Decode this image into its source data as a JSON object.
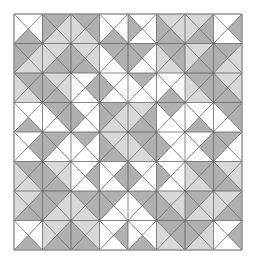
{
  "figure": {
    "type": "geometric-quilt-pattern"
  },
  "canvas": {
    "width": 256,
    "height": 262,
    "background": "#ffffff"
  },
  "pattern": {
    "origin_x": 14,
    "origin_y": 14,
    "grid_cols": 8,
    "grid_rows": 8,
    "cell_width": 28.5,
    "cell_height": 29.5,
    "stroke_color": "#555555",
    "stroke_width": 0.7,
    "outer_border_color": "#9a9a9a",
    "outer_border_width": 1
  },
  "palette": {
    "white": "#ffffff",
    "light_gray": "#d8d8d8",
    "medium_gray": "#b0b0b0",
    "line": "#555555"
  },
  "legend": {
    "swatches": [
      {
        "name": "white",
        "color": "#ffffff",
        "label": "White"
      },
      {
        "name": "light",
        "color": "#d8d8d8",
        "label": "Light gray"
      },
      {
        "name": "medium",
        "color": "#b0b0b0",
        "label": "Medium gray"
      }
    ]
  },
  "chart_data": {
    "type": "heatmap",
    "xlabel": "",
    "ylabel": "",
    "grid": true,
    "legend_position": "none",
    "categories": [
      "c0",
      "c1",
      "c2",
      "c3",
      "c4",
      "c5",
      "c6",
      "c7"
    ],
    "note": "Each of the 64 cells holds four triangles ordered north, east, south, west. Values: w = white, l = light gray, m = medium gray.",
    "cells": [
      [
        [
          "w",
          "w",
          "m",
          "w"
        ],
        [
          "m",
          "l",
          "l",
          "m"
        ],
        [
          "m",
          "m",
          "l",
          "l"
        ],
        [
          "w",
          "w",
          "m",
          "w"
        ],
        [
          "w",
          "w",
          "w",
          "m"
        ],
        [
          "l",
          "l",
          "m",
          "m"
        ],
        [
          "l",
          "m",
          "m",
          "l"
        ],
        [
          "w",
          "m",
          "w",
          "w"
        ]
      ],
      [
        [
          "m",
          "l",
          "l",
          "m"
        ],
        [
          "l",
          "m",
          "m",
          "l"
        ],
        [
          "l",
          "l",
          "m",
          "m"
        ],
        [
          "m",
          "m",
          "w",
          "w"
        ],
        [
          "m",
          "w",
          "w",
          "m"
        ],
        [
          "m",
          "m",
          "l",
          "l"
        ],
        [
          "l",
          "m",
          "m",
          "l"
        ],
        [
          "m",
          "l",
          "l",
          "m"
        ]
      ],
      [
        [
          "m",
          "m",
          "l",
          "l"
        ],
        [
          "l",
          "l",
          "m",
          "m"
        ],
        [
          "w",
          "m",
          "w",
          "w"
        ],
        [
          "w",
          "w",
          "w",
          "m"
        ],
        [
          "m",
          "w",
          "w",
          "w"
        ],
        [
          "w",
          "w",
          "m",
          "w"
        ],
        [
          "m",
          "m",
          "l",
          "l"
        ],
        [
          "l",
          "l",
          "m",
          "m"
        ]
      ],
      [
        [
          "w",
          "w",
          "m",
          "w"
        ],
        [
          "m",
          "m",
          "w",
          "w"
        ],
        [
          "w",
          "w",
          "w",
          "m"
        ],
        [
          "m",
          "l",
          "l",
          "m"
        ],
        [
          "l",
          "m",
          "m",
          "l"
        ],
        [
          "m",
          "w",
          "w",
          "w"
        ],
        [
          "w",
          "w",
          "m",
          "w"
        ],
        [
          "m",
          "m",
          "w",
          "w"
        ]
      ],
      [
        [
          "w",
          "m",
          "w",
          "w"
        ],
        [
          "m",
          "w",
          "w",
          "m"
        ],
        [
          "m",
          "w",
          "w",
          "w"
        ],
        [
          "l",
          "l",
          "m",
          "m"
        ],
        [
          "m",
          "m",
          "l",
          "l"
        ],
        [
          "w",
          "w",
          "w",
          "m"
        ],
        [
          "w",
          "m",
          "w",
          "w"
        ],
        [
          "m",
          "w",
          "w",
          "m"
        ]
      ],
      [
        [
          "m",
          "m",
          "l",
          "l"
        ],
        [
          "l",
          "l",
          "m",
          "m"
        ],
        [
          "w",
          "m",
          "w",
          "w"
        ],
        [
          "w",
          "m",
          "w",
          "w"
        ],
        [
          "w",
          "w",
          "w",
          "m"
        ],
        [
          "w",
          "w",
          "w",
          "m"
        ],
        [
          "m",
          "m",
          "l",
          "l"
        ],
        [
          "l",
          "l",
          "m",
          "m"
        ]
      ],
      [
        [
          "l",
          "m",
          "m",
          "l"
        ],
        [
          "m",
          "l",
          "l",
          "m"
        ],
        [
          "m",
          "m",
          "l",
          "l"
        ],
        [
          "m",
          "w",
          "w",
          "m"
        ],
        [
          "m",
          "m",
          "w",
          "w"
        ],
        [
          "l",
          "l",
          "m",
          "m"
        ],
        [
          "m",
          "l",
          "l",
          "m"
        ],
        [
          "l",
          "m",
          "m",
          "l"
        ]
      ],
      [
        [
          "w",
          "w",
          "m",
          "w"
        ],
        [
          "l",
          "m",
          "m",
          "l"
        ],
        [
          "l",
          "l",
          "m",
          "m"
        ],
        [
          "w",
          "m",
          "w",
          "w"
        ],
        [
          "w",
          "w",
          "m",
          "w"
        ],
        [
          "m",
          "m",
          "l",
          "l"
        ],
        [
          "m",
          "l",
          "l",
          "m"
        ],
        [
          "w",
          "m",
          "w",
          "w"
        ]
      ]
    ]
  }
}
